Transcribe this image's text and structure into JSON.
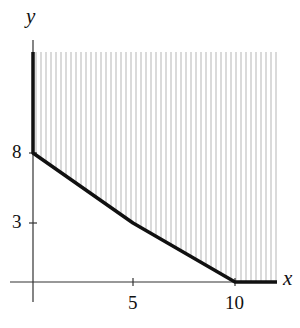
{
  "axes": {
    "x_label": "x",
    "y_label": "y",
    "x_ticks": [
      {
        "value": 5,
        "label": "5"
      },
      {
        "value": 10,
        "label": "10"
      }
    ],
    "y_ticks": [
      {
        "value": 3,
        "label": "3"
      },
      {
        "value": 8,
        "label": "8"
      }
    ]
  },
  "chart_data": {
    "type": "area",
    "title": "",
    "xlabel": "x",
    "ylabel": "y",
    "boundary_points": [
      [
        0,
        12
      ],
      [
        0,
        8
      ],
      [
        5,
        3
      ],
      [
        10,
        0
      ],
      [
        12,
        0
      ]
    ],
    "region": "shaded feasible region above the boundary (hatched with vertical lines)",
    "xlim": [
      0,
      12
    ],
    "ylim": [
      0,
      12
    ],
    "grid": false
  }
}
